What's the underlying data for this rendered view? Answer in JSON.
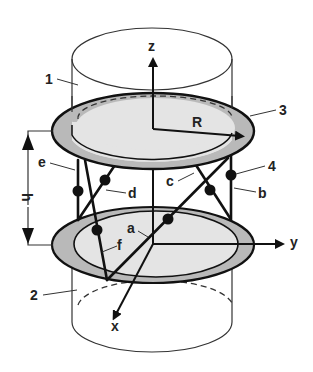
{
  "figure": {
    "labels": {
      "z_axis": "z",
      "y_axis": "y",
      "x_axis": "x",
      "radius": "R",
      "height": "h",
      "part_1": "1",
      "part_2": "2",
      "part_3": "3",
      "part_4": "4",
      "leg_a": "a",
      "leg_b": "b",
      "leg_c": "c",
      "leg_d": "d",
      "leg_e": "e",
      "leg_f": "f"
    },
    "colors": {
      "ring": "#b9b9b9",
      "disk": "#e4e4e4",
      "stroke": "#111111"
    }
  }
}
